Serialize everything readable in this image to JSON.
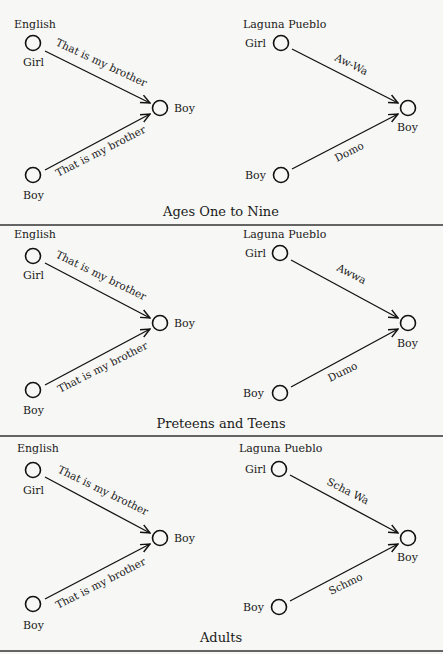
{
  "panels": [
    {
      "title": "Ages One to Nine",
      "english": {
        "heading": "English",
        "girl_label": "Girl",
        "boy_source_label": "Boy",
        "boy_target_label": "Boy",
        "girl_edge_label": "That is my brother",
        "boy_edge_label": "That is my brother"
      },
      "laguna": {
        "heading": "Laguna Pueblo",
        "girl_label": "Girl",
        "boy_source_label": "Boy",
        "boy_target_label": "Boy",
        "girl_edge_label": "Aw-Wa",
        "boy_edge_label": "Domo"
      }
    },
    {
      "title": "Preteens and Teens",
      "english": {
        "heading": "English",
        "girl_label": "Girl",
        "boy_source_label": "Boy",
        "boy_target_label": "Boy",
        "girl_edge_label": "That is my brother",
        "boy_edge_label": "That is my brother"
      },
      "laguna": {
        "heading": "Laguna Pueblo",
        "girl_label": "Girl",
        "boy_source_label": "Boy",
        "boy_target_label": "Boy",
        "girl_edge_label": "Awwa",
        "boy_edge_label": "Dumo"
      }
    },
    {
      "title": "Adults",
      "english": {
        "heading": "English",
        "girl_label": "Girl",
        "boy_source_label": "Boy",
        "boy_target_label": "Boy",
        "girl_edge_label": "That is my brother",
        "boy_edge_label": "That is my brother"
      },
      "laguna": {
        "heading": "Laguna Pueblo",
        "girl_label": "Girl",
        "boy_source_label": "Boy",
        "boy_target_label": "Boy",
        "girl_edge_label": "Scha Wa",
        "boy_edge_label": "Schmo"
      }
    }
  ]
}
